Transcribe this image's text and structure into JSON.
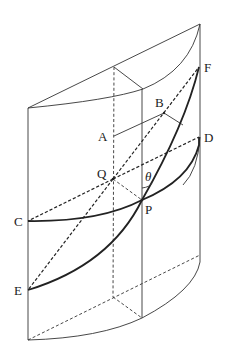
{
  "diagram": {
    "type": "geometry-figure",
    "labels": {
      "A": "A",
      "B": "B",
      "C": "C",
      "D": "D",
      "E": "E",
      "F": "F",
      "P": "P",
      "Q": "Q",
      "theta": "θ"
    },
    "points": {
      "A": [
        114,
        136
      ],
      "B": [
        164,
        113
      ],
      "C": [
        28,
        221
      ],
      "D": [
        199,
        137
      ],
      "E": [
        28,
        290
      ],
      "F": [
        199,
        67
      ],
      "P": [
        142,
        200
      ],
      "Q": [
        113,
        179
      ]
    },
    "colors": {
      "line": "#333333",
      "curve": "#222222",
      "background": "#ffffff"
    }
  }
}
